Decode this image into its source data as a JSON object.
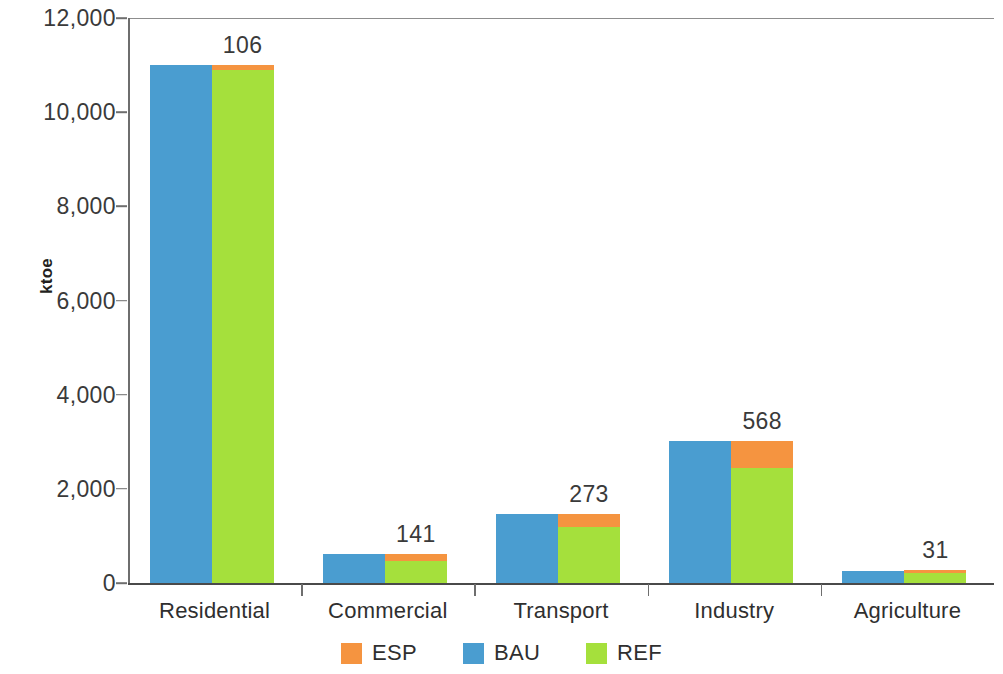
{
  "chart_data": {
    "type": "bar",
    "title": "",
    "subtitle": "",
    "xlabel": "",
    "ylabel": "ktoe",
    "ylim": [
      0,
      12000
    ],
    "ytick_labels": [
      "12,000",
      "10,000",
      "8,000",
      "6,000",
      "4,000",
      "2,000",
      "0"
    ],
    "ytick_values": [
      12000,
      10000,
      8000,
      6000,
      4000,
      2000,
      0
    ],
    "grid": false,
    "legend_position": "bottom-center",
    "categories": [
      "Residential",
      "Commercial",
      "Transport",
      "Industry",
      "Agriculture"
    ],
    "series": [
      {
        "name": "ESP",
        "color": "#f59440",
        "values": [
          106,
          141,
          273,
          568,
          31
        ]
      },
      {
        "name": "BAU",
        "color": "#4a9dd0",
        "values": [
          11000,
          615,
          1465,
          3008,
          250
        ]
      },
      {
        "name": "REF",
        "color": "#a5e03c",
        "values": [
          10894,
          474,
          1192,
          2440,
          219
        ]
      }
    ],
    "stacking_note": "Right-hand bar of each pair stacks REF (bottom) + ESP (top); left-hand bar is BAU.",
    "data_labels": [
      "106",
      "141",
      "273",
      "568",
      "31"
    ]
  },
  "legend": {
    "items": [
      {
        "label": "ESP",
        "color": "#f59440"
      },
      {
        "label": "BAU",
        "color": "#4a9dd0"
      },
      {
        "label": "REF",
        "color": "#a5e03c"
      }
    ]
  },
  "axis": {
    "y_title": "ktoe"
  }
}
